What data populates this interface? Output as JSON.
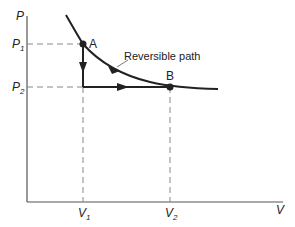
{
  "diagram": {
    "axes": {
      "y_label": "P",
      "x_label": "V",
      "y_ticks": [
        {
          "base": "P",
          "sub": "1"
        },
        {
          "base": "P",
          "sub": "2"
        }
      ],
      "x_ticks": [
        {
          "base": "V",
          "sub": "1"
        },
        {
          "base": "V",
          "sub": "2"
        }
      ]
    },
    "points": [
      {
        "label": "A",
        "P": "P1",
        "V": "V1"
      },
      {
        "label": "B",
        "P": "P2",
        "V": "V2"
      }
    ],
    "annotations": {
      "curve_label": "Reversible path"
    },
    "paths": [
      {
        "name": "reversible-path",
        "type": "curve",
        "from": "A",
        "to": "B"
      },
      {
        "name": "isochoric-step",
        "type": "vertical",
        "from": "A",
        "to": "(V1,P2)"
      },
      {
        "name": "isobaric-step",
        "type": "horizontal",
        "from": "(V1,P2)",
        "to": "B"
      }
    ],
    "colors": {
      "line": "#222222",
      "guide": "#888888",
      "background": "#ffffff"
    }
  }
}
